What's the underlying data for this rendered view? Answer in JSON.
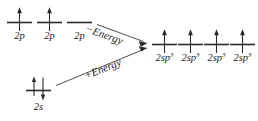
{
  "diagram": {
    "colors": {
      "background": "#ffffff",
      "line": "#2b2b2b",
      "text": "#1a1a1a",
      "arrow": "#3a3a3a"
    },
    "left_groups": [
      {
        "group_name": "2p-orbitals",
        "orbitals": [
          {
            "label_base": "2p",
            "label_sup": "",
            "electrons": [
              "up"
            ]
          },
          {
            "label_base": "2p",
            "label_sup": "",
            "electrons": [
              "up"
            ]
          },
          {
            "label_base": "2p",
            "label_sup": "",
            "electrons": []
          }
        ]
      },
      {
        "group_name": "2s-orbital",
        "orbitals": [
          {
            "label_base": "2s",
            "label_sup": "",
            "electrons": [
              "up",
              "down"
            ]
          }
        ]
      }
    ],
    "right_group": {
      "group_name": "2sp3-hybrid-orbitals",
      "orbitals": [
        {
          "label_base": "2sp",
          "label_sup": "3",
          "electrons": [
            "up"
          ]
        },
        {
          "label_base": "2sp",
          "label_sup": "3",
          "electrons": [
            "up"
          ]
        },
        {
          "label_base": "2sp",
          "label_sup": "3",
          "electrons": [
            "up"
          ]
        },
        {
          "label_base": "2sp",
          "label_sup": "3",
          "electrons": [
            "up"
          ]
        }
      ]
    },
    "transitions": [
      {
        "name": "energy-decrease",
        "label": "−Energy",
        "direction": "down-right"
      },
      {
        "name": "energy-increase",
        "label": "+Energy",
        "direction": "up-right"
      }
    ]
  }
}
